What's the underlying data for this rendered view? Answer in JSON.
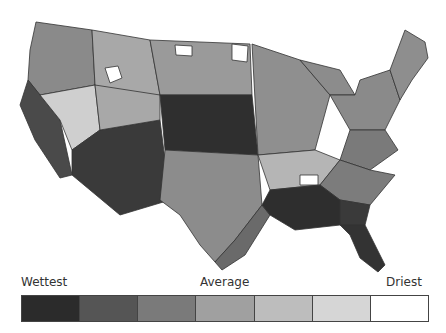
{
  "map": {
    "subject": "Contiguous United States climate divisions, precipitation ranking",
    "stroke_color": "#333333",
    "region_fills": {
      "pacific_northwest": "#8a8a8a",
      "california_coast": "#4a4a4a",
      "great_basin_light": "#cfcfcf",
      "southwest": "#3a3a3a",
      "northern_rockies": "#a8a8a8",
      "montana_white": "#ffffff",
      "northern_plains": "#9a9a9a",
      "central_plains": "#2f2f2f",
      "texas": "#8c8c8c",
      "texas_south": "#6a6a6a",
      "midwest": "#8f8f8f",
      "great_lakes": "#8c8c8c",
      "northeast": "#8a8a8a",
      "new_england": "#8e8e8e",
      "mid_atlantic": "#7a7a7a",
      "tennessee_valley": "#b5b5b5",
      "southeast_coast": "#3a3a3a",
      "florida": "#333333",
      "gulf_coast": "#2e2e2e",
      "carolinas": "#7c7c7c"
    }
  },
  "legend": {
    "label_wettest": "Wettest",
    "label_average": "Average",
    "label_driest": "Driest",
    "swatches": [
      {
        "rank": 1,
        "color": "#2b2b2b"
      },
      {
        "rank": 2,
        "color": "#555555"
      },
      {
        "rank": 3,
        "color": "#7a7a7a"
      },
      {
        "rank": 4,
        "color": "#a0a0a0"
      },
      {
        "rank": 5,
        "color": "#bdbdbd"
      },
      {
        "rank": 6,
        "color": "#d6d6d6"
      },
      {
        "rank": 7,
        "color": "#ffffff"
      }
    ]
  }
}
